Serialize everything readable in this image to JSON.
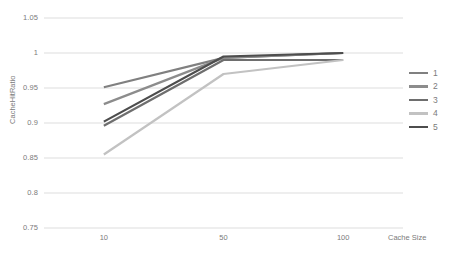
{
  "chart_data": {
    "type": "line",
    "title": "",
    "xlabel": "Cache Size",
    "ylabel": "CacheHitRatio",
    "categories": [
      "10",
      "50",
      "100"
    ],
    "x_tick_labels": [
      "10",
      "50",
      "100"
    ],
    "y_tick_labels": [
      "1.05",
      "1",
      "0.95",
      "0.9",
      "0.85",
      "0.8",
      "0.75"
    ],
    "y_tick_values": [
      1.05,
      1.0,
      0.95,
      0.9,
      0.85,
      0.8,
      0.75
    ],
    "ylim": [
      0.75,
      1.05
    ],
    "grid": true,
    "grid_axis": "y",
    "legend_position": "right",
    "series": [
      {
        "name": "1",
        "color": "#808080",
        "values": [
          0.951,
          0.993,
          1.0
        ]
      },
      {
        "name": "2",
        "color": "#8c8c8c",
        "values": [
          0.927,
          0.993,
          1.0
        ]
      },
      {
        "name": "3",
        "color": "#6e6e6e",
        "values": [
          0.896,
          0.99,
          0.99
        ]
      },
      {
        "name": "4",
        "color": "#c2c2c2",
        "values": [
          0.855,
          0.97,
          0.99
        ]
      },
      {
        "name": "5",
        "color": "#4d4d4d",
        "values": [
          0.902,
          0.995,
          1.0
        ]
      }
    ]
  },
  "legend": {
    "entries": [
      {
        "label": "1"
      },
      {
        "label": "2"
      },
      {
        "label": "3"
      },
      {
        "label": "4"
      },
      {
        "label": "5"
      }
    ]
  },
  "axes": {
    "y_title": "CacheHitRatio",
    "x_title": "Cache Size"
  },
  "colors": {
    "grid": "#d9d9d9",
    "tick_text": "#7b7b7b",
    "background": "#ffffff"
  }
}
